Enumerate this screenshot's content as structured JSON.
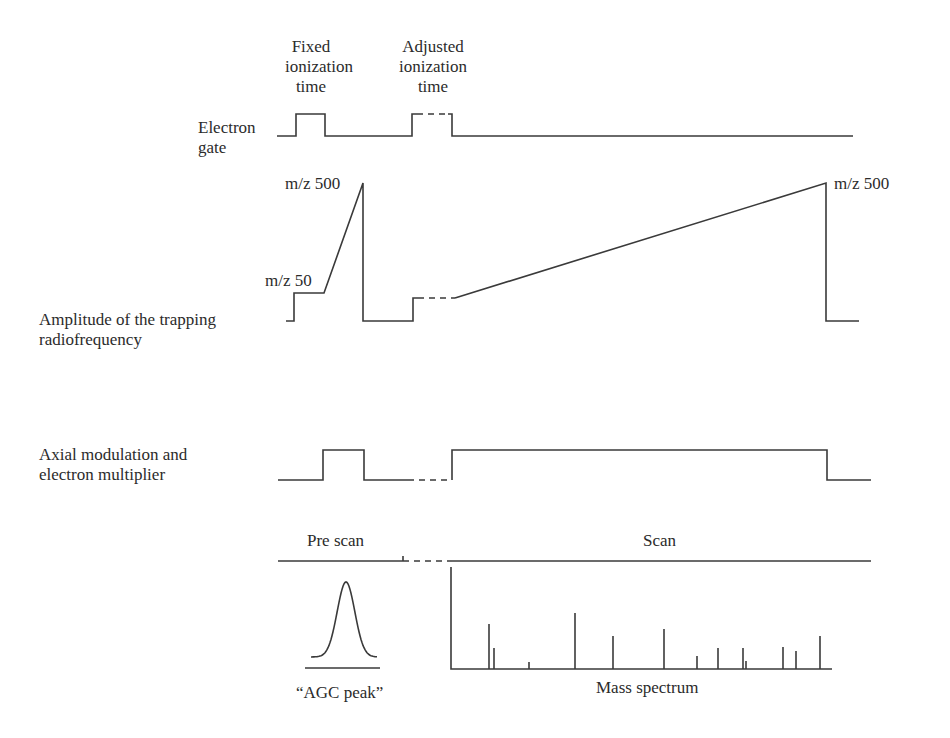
{
  "labels": {
    "fixed_ionization": [
      "Fixed",
      "ionization",
      "time"
    ],
    "adjusted_ionization": [
      "Adjusted",
      "ionization",
      "time"
    ],
    "electron_gate": [
      "Electron",
      "gate"
    ],
    "rf_amplitude": [
      "Amplitude of the trapping",
      "radiofrequency"
    ],
    "axial_modulation": [
      "Axial modulation and",
      "electron multiplier"
    ],
    "mz_500_prescan": "m/z 500",
    "mz_50": "m/z 50",
    "mz_500_scan": "m/z 500",
    "pre_scan": "Pre scan",
    "scan": "Scan",
    "agc_peak": "“AGC peak”",
    "mass_spectrum": "Mass spectrum"
  },
  "waveforms": {
    "electron_gate": {
      "solid": [
        "277,136 296,136 296,114 325,114 325,136 412,136 412,114 417,114",
        "448,114 452,114 452,136 853,136"
      ],
      "dashed": [
        "417,114 448,114"
      ]
    },
    "rf_amplitude": {
      "solid": [
        "286,321 294,321 294,293 324,293 363,183 363,321 413,321 413,298 418,298",
        "455,298 826,183 826,321 859,321"
      ],
      "dashed": [
        "418,298 455,298"
      ]
    },
    "axial_modulation": {
      "solid": [
        "278,480 323,480 323,450 364,450 364,480 408,480",
        "452,480 452,450 827,450 827,480 871,480"
      ],
      "dashed": [
        "408,480 450,480"
      ]
    },
    "timeline": {
      "solid": [
        "278,561 403,561",
        "452,561 871,561",
        "403,556 403,561"
      ],
      "dashed": [
        "403,561 452,561"
      ]
    }
  },
  "agc_peak": {
    "center_x": 346,
    "peak_y": 582,
    "base_y": 657,
    "left_x": 311,
    "right_x": 377,
    "baseline_y": 668,
    "baseline_x1": 305,
    "baseline_x2": 380
  },
  "mass_spectrum": {
    "axis": {
      "x": 451,
      "top_y": 567,
      "bottom_y": 669,
      "right_x": 832
    },
    "peaks": [
      {
        "x": 489,
        "top": 624
      },
      {
        "x": 494,
        "top": 648
      },
      {
        "x": 529,
        "top": 662
      },
      {
        "x": 575,
        "top": 613
      },
      {
        "x": 613,
        "top": 636
      },
      {
        "x": 664,
        "top": 629
      },
      {
        "x": 697,
        "top": 656
      },
      {
        "x": 718,
        "top": 648
      },
      {
        "x": 743,
        "top": 648
      },
      {
        "x": 746,
        "top": 661
      },
      {
        "x": 783,
        "top": 647
      },
      {
        "x": 796,
        "top": 651
      },
      {
        "x": 820,
        "top": 636
      }
    ]
  }
}
